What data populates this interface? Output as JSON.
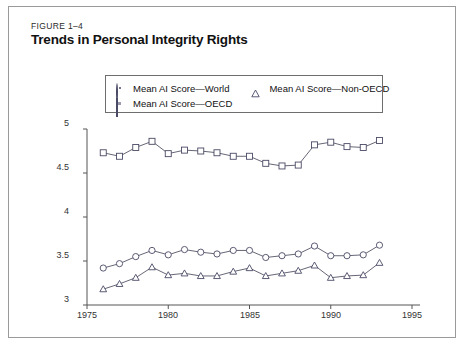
{
  "figure": {
    "label": "FIGURE 1–4",
    "title": "Trends in Personal Integrity Rights"
  },
  "legend": {
    "position": "top-center-inside",
    "entries": [
      {
        "marker": "circle-icon",
        "label": "Mean AI Score—World"
      },
      {
        "marker": "triangle-icon",
        "label": "Mean AI Score—Non-OECD"
      },
      {
        "marker": "square-icon",
        "label": "Mean AI Score—OECD"
      }
    ]
  },
  "colors": {
    "line": "#555566",
    "marker_edge": "#4a4a66",
    "marker_fill": "#ffffff",
    "axis": "#555555",
    "panel_border": "#9a9a9a",
    "text": "#111111"
  },
  "chart_data": {
    "type": "line",
    "title": "Trends in Personal Integrity Rights",
    "xlabel": "",
    "ylabel": "",
    "xlim": [
      1975,
      1995
    ],
    "ylim": [
      3,
      5
    ],
    "grid": false,
    "legend_position": "top-center-inside",
    "xticks": [
      1975,
      1980,
      1985,
      1990,
      1995
    ],
    "yticks": [
      3,
      3.5,
      4,
      4.5,
      5
    ],
    "x": [
      1976,
      1977,
      1978,
      1979,
      1980,
      1981,
      1982,
      1983,
      1984,
      1985,
      1986,
      1987,
      1988,
      1989,
      1990,
      1991,
      1992,
      1993
    ],
    "series": [
      {
        "name": "Mean AI Score—OECD",
        "marker": "square",
        "values": [
          4.73,
          4.69,
          4.79,
          4.86,
          4.72,
          4.76,
          4.75,
          4.73,
          4.69,
          4.69,
          4.61,
          4.58,
          4.59,
          4.82,
          4.85,
          4.8,
          4.79,
          4.87
        ]
      },
      {
        "name": "Mean AI Score—World",
        "marker": "circle",
        "values": [
          3.42,
          3.47,
          3.55,
          3.62,
          3.57,
          3.63,
          3.6,
          3.58,
          3.62,
          3.62,
          3.54,
          3.56,
          3.58,
          3.67,
          3.56,
          3.56,
          3.57,
          3.68
        ]
      },
      {
        "name": "Mean AI Score—Non-OECD",
        "marker": "triangle",
        "values": [
          3.18,
          3.24,
          3.31,
          3.43,
          3.34,
          3.36,
          3.33,
          3.33,
          3.38,
          3.42,
          3.33,
          3.36,
          3.39,
          3.45,
          3.31,
          3.33,
          3.34,
          3.48
        ]
      }
    ]
  },
  "axis_labels": {
    "y": [
      "5",
      "4.5",
      "4",
      "3.5",
      "3"
    ],
    "x": [
      "1975",
      "1980",
      "1985",
      "1990",
      "1995"
    ]
  }
}
